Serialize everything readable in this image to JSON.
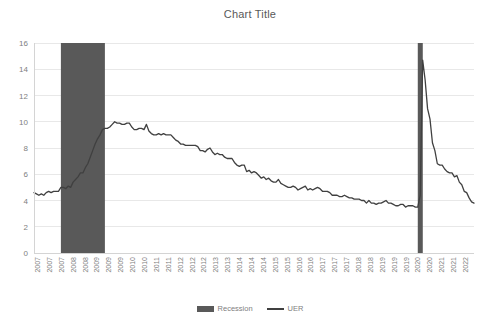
{
  "chart_data": {
    "type": "line",
    "title": "Chart Title",
    "xlabel": "",
    "ylabel": "",
    "ylim": [
      0,
      16
    ],
    "yticks": [
      0,
      2,
      4,
      6,
      8,
      10,
      12,
      14,
      16
    ],
    "grid": true,
    "legend_position": "bottom",
    "legend": [
      {
        "name": "Recession",
        "marker": "filled-rect",
        "color": "#595959"
      },
      {
        "name": "UER",
        "marker": "line",
        "color": "#404040"
      }
    ],
    "xtick_labels": [
      "2007",
      "2007",
      "2007",
      "2008",
      "2008",
      "2009",
      "2009",
      "2009",
      "2010",
      "2010",
      "2011",
      "2011",
      "2012",
      "2012",
      "2012",
      "2013",
      "2013",
      "2014",
      "2014",
      "2014",
      "2015",
      "2015",
      "2016",
      "2016",
      "2017",
      "2017",
      "2017",
      "2018",
      "2018",
      "2019",
      "2019",
      "2019",
      "2020",
      "2020",
      "2021",
      "2021",
      "2022"
    ],
    "x_start": "2007-01",
    "x_end": "2022-01",
    "series": [
      {
        "name": "UER",
        "color": "#404040",
        "x": [
          "2007-01",
          "2007-02",
          "2007-03",
          "2007-04",
          "2007-05",
          "2007-06",
          "2007-07",
          "2007-08",
          "2007-09",
          "2007-10",
          "2007-11",
          "2007-12",
          "2008-01",
          "2008-02",
          "2008-03",
          "2008-04",
          "2008-05",
          "2008-06",
          "2008-07",
          "2008-08",
          "2008-09",
          "2008-10",
          "2008-11",
          "2008-12",
          "2009-01",
          "2009-02",
          "2009-03",
          "2009-04",
          "2009-05",
          "2009-06",
          "2009-07",
          "2009-08",
          "2009-09",
          "2009-10",
          "2009-11",
          "2009-12",
          "2010-01",
          "2010-02",
          "2010-03",
          "2010-04",
          "2010-05",
          "2010-06",
          "2010-07",
          "2010-08",
          "2010-09",
          "2010-10",
          "2010-11",
          "2010-12",
          "2011-01",
          "2011-02",
          "2011-03",
          "2011-04",
          "2011-05",
          "2011-06",
          "2011-07",
          "2011-08",
          "2011-09",
          "2011-10",
          "2011-11",
          "2011-12",
          "2012-01",
          "2012-02",
          "2012-03",
          "2012-04",
          "2012-05",
          "2012-06",
          "2012-07",
          "2012-08",
          "2012-09",
          "2012-10",
          "2012-11",
          "2012-12",
          "2013-01",
          "2013-02",
          "2013-03",
          "2013-04",
          "2013-05",
          "2013-06",
          "2013-07",
          "2013-08",
          "2013-09",
          "2013-10",
          "2013-11",
          "2013-12",
          "2014-01",
          "2014-02",
          "2014-03",
          "2014-04",
          "2014-05",
          "2014-06",
          "2014-07",
          "2014-08",
          "2014-09",
          "2014-10",
          "2014-11",
          "2014-12",
          "2015-01",
          "2015-02",
          "2015-03",
          "2015-04",
          "2015-05",
          "2015-06",
          "2015-07",
          "2015-08",
          "2015-09",
          "2015-10",
          "2015-11",
          "2015-12",
          "2016-01",
          "2016-02",
          "2016-03",
          "2016-04",
          "2016-05",
          "2016-06",
          "2016-07",
          "2016-08",
          "2016-09",
          "2016-10",
          "2016-11",
          "2016-12",
          "2017-01",
          "2017-02",
          "2017-03",
          "2017-04",
          "2017-05",
          "2017-06",
          "2017-07",
          "2017-08",
          "2017-09",
          "2017-10",
          "2017-11",
          "2017-12",
          "2018-01",
          "2018-02",
          "2018-03",
          "2018-04",
          "2018-05",
          "2018-06",
          "2018-07",
          "2018-08",
          "2018-09",
          "2018-10",
          "2018-11",
          "2018-12",
          "2019-01",
          "2019-02",
          "2019-03",
          "2019-04",
          "2019-05",
          "2019-06",
          "2019-07",
          "2019-08",
          "2019-09",
          "2019-10",
          "2019-11",
          "2019-12",
          "2020-01",
          "2020-02",
          "2020-03",
          "2020-04",
          "2020-05",
          "2020-06",
          "2020-07",
          "2020-08",
          "2020-09",
          "2020-10",
          "2020-11",
          "2020-12",
          "2021-01",
          "2021-02",
          "2021-03",
          "2021-04",
          "2021-05",
          "2021-06",
          "2021-07",
          "2021-08",
          "2021-09",
          "2021-10",
          "2021-11",
          "2021-12",
          "2022-01"
        ],
        "values": [
          4.6,
          4.5,
          4.4,
          4.5,
          4.4,
          4.6,
          4.7,
          4.6,
          4.7,
          4.7,
          4.7,
          5.0,
          5.0,
          4.9,
          5.1,
          5.0,
          5.4,
          5.6,
          5.8,
          6.1,
          6.1,
          6.5,
          6.8,
          7.3,
          7.8,
          8.3,
          8.7,
          9.0,
          9.4,
          9.5,
          9.5,
          9.6,
          9.8,
          10.0,
          9.9,
          9.9,
          9.8,
          9.8,
          9.9,
          9.9,
          9.6,
          9.4,
          9.4,
          9.5,
          9.5,
          9.4,
          9.8,
          9.3,
          9.1,
          9.0,
          9.0,
          9.1,
          9.0,
          9.1,
          9.0,
          9.0,
          9.0,
          8.8,
          8.6,
          8.5,
          8.3,
          8.3,
          8.2,
          8.2,
          8.2,
          8.2,
          8.2,
          8.1,
          7.8,
          7.8,
          7.7,
          7.9,
          8.0,
          7.7,
          7.5,
          7.6,
          7.5,
          7.5,
          7.3,
          7.2,
          7.2,
          7.2,
          6.9,
          6.7,
          6.6,
          6.7,
          6.7,
          6.2,
          6.3,
          6.1,
          6.2,
          6.1,
          5.9,
          5.7,
          5.8,
          5.6,
          5.7,
          5.5,
          5.4,
          5.4,
          5.6,
          5.3,
          5.2,
          5.1,
          5.0,
          5.0,
          5.1,
          5.0,
          4.8,
          4.9,
          5.0,
          5.1,
          4.8,
          4.9,
          4.8,
          4.9,
          5.0,
          4.9,
          4.7,
          4.7,
          4.7,
          4.6,
          4.4,
          4.4,
          4.4,
          4.3,
          4.3,
          4.4,
          4.3,
          4.2,
          4.2,
          4.1,
          4.1,
          4.1,
          4.0,
          4.0,
          3.8,
          4.0,
          3.8,
          3.8,
          3.7,
          3.8,
          3.8,
          3.9,
          4.0,
          3.8,
          3.8,
          3.7,
          3.6,
          3.6,
          3.7,
          3.7,
          3.5,
          3.6,
          3.6,
          3.6,
          3.5,
          3.5,
          4.4,
          14.7,
          13.2,
          11.0,
          10.2,
          8.4,
          7.8,
          6.8,
          6.7,
          6.7,
          6.4,
          6.2,
          6.1,
          6.1,
          5.8,
          5.9,
          5.4,
          5.2,
          4.7,
          4.6,
          4.2,
          3.9,
          3.8
        ]
      }
    ],
    "recessions": [
      {
        "label": "Recession",
        "start": "2007-12",
        "end": "2009-06",
        "color": "#595959"
      },
      {
        "label": "Recession",
        "start": "2020-02",
        "end": "2020-04",
        "color": "#595959"
      }
    ]
  }
}
